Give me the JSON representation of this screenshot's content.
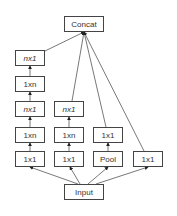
{
  "diagram": {
    "nodes": {
      "concat": {
        "label": "Concat"
      },
      "input": {
        "label": "Input"
      },
      "b1_1x1": {
        "label": "1x1"
      },
      "b1_1xn_a": {
        "label": "1xn"
      },
      "b1_nx1_a": {
        "label": "nx1"
      },
      "b1_1xn_b": {
        "label": "1xn"
      },
      "b1_nx1_b": {
        "label": "nx1"
      },
      "b2_1x1": {
        "label": "1x1"
      },
      "b2_1xn": {
        "label": "1xn"
      },
      "b2_nx1": {
        "label": "nx1"
      },
      "b3_pool": {
        "label": "Pool"
      },
      "b3_1x1": {
        "label": "1x1"
      },
      "b4_1x1": {
        "label": "1x1"
      }
    },
    "edges": [
      [
        "input",
        "b1_1x1"
      ],
      [
        "b1_1x1",
        "b1_1xn_a"
      ],
      [
        "b1_1xn_a",
        "b1_nx1_a"
      ],
      [
        "b1_nx1_a",
        "b1_1xn_b"
      ],
      [
        "b1_1xn_b",
        "b1_nx1_b"
      ],
      [
        "b1_nx1_b",
        "concat"
      ],
      [
        "input",
        "b2_1x1"
      ],
      [
        "b2_1x1",
        "b2_1xn"
      ],
      [
        "b2_1xn",
        "b2_nx1"
      ],
      [
        "b2_nx1",
        "concat"
      ],
      [
        "input",
        "b3_pool"
      ],
      [
        "b3_pool",
        "b3_1x1"
      ],
      [
        "b3_1x1",
        "concat"
      ],
      [
        "input",
        "b4_1x1"
      ],
      [
        "b4_1x1",
        "concat"
      ]
    ]
  }
}
